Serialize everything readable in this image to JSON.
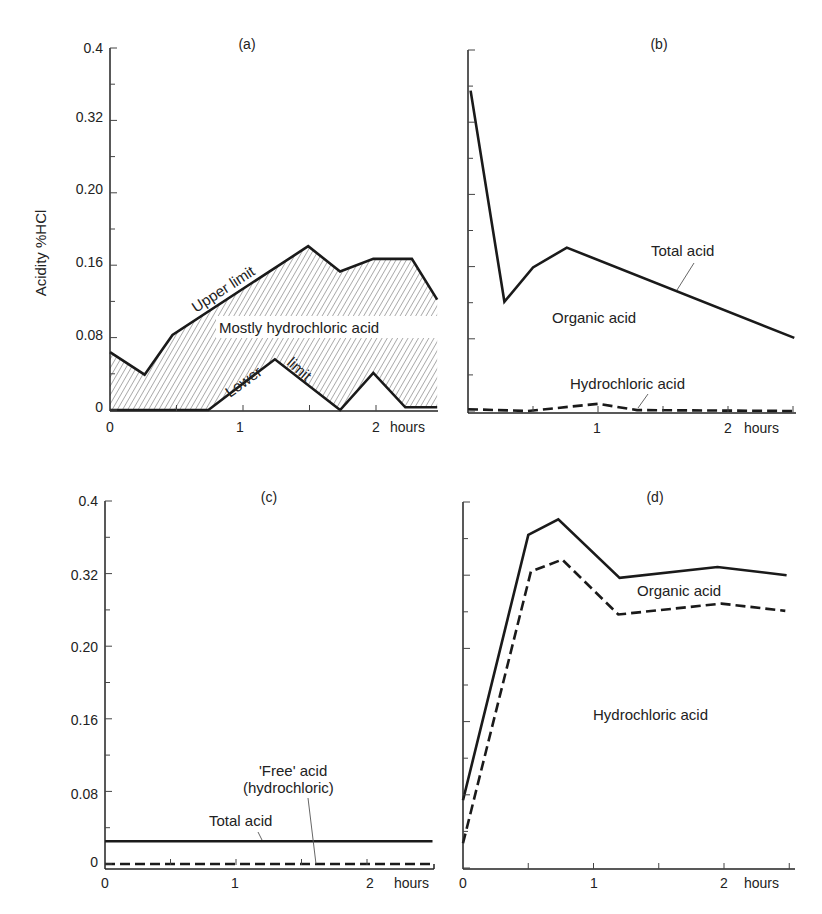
{
  "figure": {
    "y_axis_title": "Acidity %HCl",
    "x_unit": "hours"
  },
  "chart_data": [
    {
      "id": "a",
      "type": "area",
      "title": "(a)",
      "xlabel": "hours",
      "ylabel": "Acidity %HCl",
      "xlim": [
        0,
        2.45
      ],
      "ylim": [
        0,
        0.4
      ],
      "x_ticks": [
        "0",
        "1",
        "2"
      ],
      "y_tick_labels": [
        "0",
        "0.08",
        "0.16",
        "0.20",
        "0.32",
        "0.4"
      ],
      "grid": false,
      "series": [
        {
          "name": "Upper limit",
          "style": "solid",
          "x": [
            0,
            0.26,
            0.47,
            1.49,
            1.73,
            1.98,
            2.27,
            2.46
          ],
          "y": [
            0.064,
            0.039,
            0.083,
            0.181,
            0.153,
            0.167,
            0.167,
            0.122
          ]
        },
        {
          "name": "Lower limit",
          "style": "solid",
          "x": [
            0,
            0.74,
            1.24,
            1.73,
            1.98,
            2.22,
            2.46
          ],
          "y": [
            0,
            0,
            0.056,
            0,
            0.041,
            0.003,
            0.003
          ]
        }
      ],
      "shaded_region": "Mostly hydrochloric acid",
      "annotations": [
        "Upper limit",
        "Lower limit",
        "Mostly hydrochloric acid"
      ]
    },
    {
      "id": "b",
      "type": "line",
      "title": "(b)",
      "xlabel": "hours",
      "xlim": [
        0,
        2.5
      ],
      "ylim": [
        0,
        0.4
      ],
      "x_ticks": [
        "1",
        "2"
      ],
      "grid": false,
      "series": [
        {
          "name": "Total acid",
          "style": "solid",
          "x": [
            0.02,
            0.28,
            0.5,
            0.76,
            2.51
          ],
          "y": [
            0.355,
            0.121,
            0.159,
            0.181,
            0.081
          ]
        },
        {
          "name": "Hydrochloric acid",
          "style": "dashed",
          "x": [
            0,
            0.46,
            1.0,
            1.3,
            2.51
          ],
          "y": [
            0.002,
            0.0,
            0.008,
            0.001,
            0.0
          ]
        }
      ],
      "annotations": [
        "Total acid",
        "Organic acid",
        "Hydrochloric acid"
      ]
    },
    {
      "id": "c",
      "type": "line",
      "title": "(c)",
      "xlabel": "hours",
      "ylabel": "Acidity %HCl",
      "xlim": [
        0,
        2.5
      ],
      "ylim": [
        0,
        0.4
      ],
      "x_ticks": [
        "0",
        "1",
        "2"
      ],
      "y_tick_labels": [
        "0",
        "0.08",
        "0.16",
        "0.20",
        "0.32",
        "0.4"
      ],
      "grid": false,
      "series": [
        {
          "name": "Total acid",
          "style": "solid",
          "x": [
            0,
            2.5
          ],
          "y": [
            0.025,
            0.025
          ]
        },
        {
          "name": "'Free' acid (hydrochloric)",
          "style": "dashed",
          "x": [
            0,
            2.5
          ],
          "y": [
            0.0,
            0.0
          ]
        }
      ],
      "annotations": [
        "'Free' acid",
        "(hydrochloric)",
        "Total acid"
      ]
    },
    {
      "id": "d",
      "type": "line",
      "title": "(d)",
      "xlabel": "hours",
      "xlim": [
        0,
        2.5
      ],
      "ylim": [
        0,
        0.4
      ],
      "x_ticks": [
        "0",
        "1",
        "2"
      ],
      "grid": false,
      "series": [
        {
          "name": "Total acid (upper)",
          "style": "solid",
          "x": [
            0,
            0.5,
            0.73,
            1.2,
            1.95,
            2.48
          ],
          "y": [
            0.074,
            0.364,
            0.381,
            0.317,
            0.329,
            0.32
          ]
        },
        {
          "name": "Hydrochloric acid (boundary)",
          "style": "dashed",
          "x": [
            0,
            0.52,
            0.76,
            1.19,
            1.98,
            2.47
          ],
          "y": [
            0.027,
            0.324,
            0.337,
            0.277,
            0.289,
            0.281
          ]
        }
      ],
      "annotations": [
        "Organic acid",
        "Hydrochloric acid"
      ]
    }
  ],
  "labels": {
    "a": {
      "title": "(a)",
      "upper": "Upper limit",
      "lower": "Lower",
      "lower2": "limit",
      "region": "Mostly hydrochloric acid",
      "y": [
        "0.4",
        "0.32",
        "0.20",
        "0.16",
        "0.08",
        "0"
      ],
      "x": [
        "0",
        "1",
        "2",
        "hours"
      ]
    },
    "b": {
      "title": "(b)",
      "total": "Total acid",
      "organic": "Organic acid",
      "hcl": "Hydrochloric acid",
      "x": [
        "1",
        "2",
        "hours"
      ]
    },
    "c": {
      "title": "(c)",
      "free1": "'Free' acid",
      "free2": "(hydrochloric)",
      "total": "Total acid",
      "y": [
        "0.4",
        "0.32",
        "0.20",
        "0.16",
        "0.08",
        "0"
      ],
      "x": [
        "0",
        "1",
        "2",
        "hours"
      ]
    },
    "d": {
      "title": "(d)",
      "organic": "Organic acid",
      "hcl": "Hydrochloric acid",
      "x": [
        "0",
        "1",
        "2",
        "hours"
      ]
    }
  }
}
